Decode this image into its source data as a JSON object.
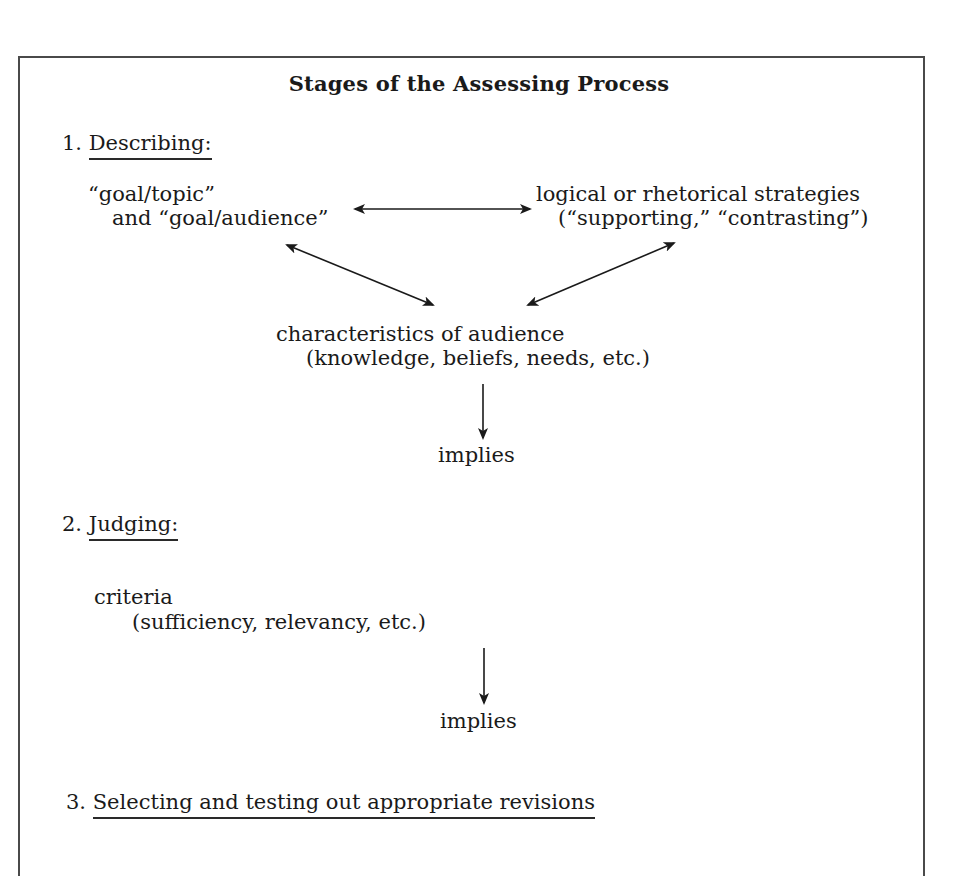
{
  "title": "Stages of the Assessing Process",
  "stages": [
    {
      "number": "1.",
      "label": "Describing:",
      "nodes": {
        "goal": {
          "line1": "“goal/topic”",
          "line2": "and “goal/audience”"
        },
        "strategies": {
          "line1": "logical or rhetorical strategies",
          "line2": "(“supporting,” “contrasting”)"
        },
        "audience": {
          "line1": "characteristics of audience",
          "line2": "(knowledge, beliefs, needs, etc.)"
        }
      },
      "connector": "implies"
    },
    {
      "number": "2.",
      "label": "Judging:",
      "nodes": {
        "criteria": {
          "line1": "criteria",
          "line2": "(sufficiency, relevancy, etc.)"
        }
      },
      "connector": "implies"
    },
    {
      "number": "3.",
      "label": "Selecting and testing out appropriate revisions"
    }
  ],
  "arrows": [
    {
      "from": "goal",
      "to": "strategies",
      "type": "bidirectional"
    },
    {
      "from": "goal",
      "to": "audience",
      "type": "bidirectional"
    },
    {
      "from": "strategies",
      "to": "audience",
      "type": "bidirectional"
    },
    {
      "from": "audience",
      "to": "implies-1",
      "type": "down"
    },
    {
      "from": "criteria",
      "to": "implies-2",
      "type": "down"
    }
  ]
}
